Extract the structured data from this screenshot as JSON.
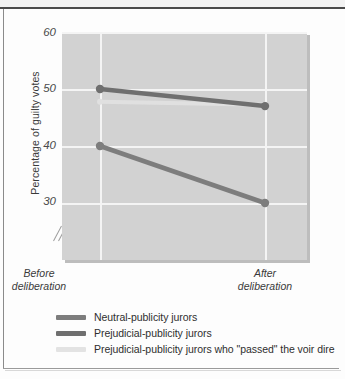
{
  "chart_data": {
    "type": "line",
    "title": "",
    "xlabel": "",
    "ylabel": "Percentage of guilty votes",
    "categories": [
      "Before deliberation",
      "After deliberation"
    ],
    "x_tick_lines": [
      [
        "Before",
        "deliberation"
      ],
      [
        "After",
        "deliberation"
      ]
    ],
    "ylim": [
      24,
      60
    ],
    "yticks": [
      30,
      40,
      50,
      60
    ],
    "ytick_labels": [
      "30",
      "40",
      "50",
      "60"
    ],
    "axis_break": true,
    "grid": "white gridlines on gray panel, horizontal at each y tick and vertical at each category",
    "legend_position": "below-plot-left",
    "series": [
      {
        "name": "Neutral-publicity jurors",
        "color": "#7d7d7d",
        "values": [
          42,
          33
        ]
      },
      {
        "name": "Prejudicial-publicity jurors",
        "color": "#6f6f6f",
        "values": [
          51,
          48.3
        ]
      },
      {
        "name": "Prejudicial-publicity jurors who \"passed\" the voir dire",
        "color": "#e0e0e0",
        "values": [
          49,
          48.5
        ]
      }
    ]
  },
  "figure": {
    "ylabel": "Percentage of guilty votes",
    "ytick_labels": [
      "60",
      "50",
      "40",
      "30"
    ],
    "xtick_before_line1": "Before",
    "xtick_before_line2": "deliberation",
    "xtick_after_line1": "After",
    "xtick_after_line2": "deliberation"
  },
  "legend": {
    "items": [
      {
        "label": "Neutral-publicity jurors",
        "color": "#7d7d7d"
      },
      {
        "label": "Prejudicial-publicity jurors",
        "color": "#6f6f6f"
      },
      {
        "label": "Prejudicial-publicity jurors who \"passed\" the voir dire",
        "color": "#e3e3e3"
      }
    ]
  },
  "colors": {
    "panel": "#d2d2d2",
    "gridline": "#f4f4f4",
    "page": "#fdfdfd",
    "rule": "#4a4a4a"
  }
}
